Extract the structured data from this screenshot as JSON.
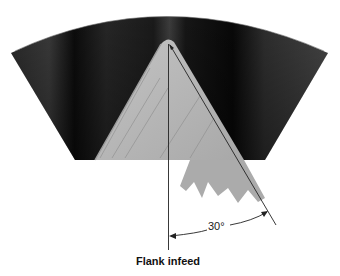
{
  "figure": {
    "caption": "Flank infeed",
    "angle_label": "30°",
    "elements": {
      "workpiece": "dark thread-groove sector",
      "tool": "triangular threading insert",
      "chip": "serrated chip",
      "reference_line": "radial infeed axis",
      "flank_line": "flank infeed direction"
    },
    "colors": {
      "background": "#ffffff",
      "workpiece_dark": "#121212",
      "workpiece_mid": "#3a3a3a",
      "tool": "#b4b4b4",
      "chip": "#a9a9a9",
      "line": "#222222"
    }
  }
}
